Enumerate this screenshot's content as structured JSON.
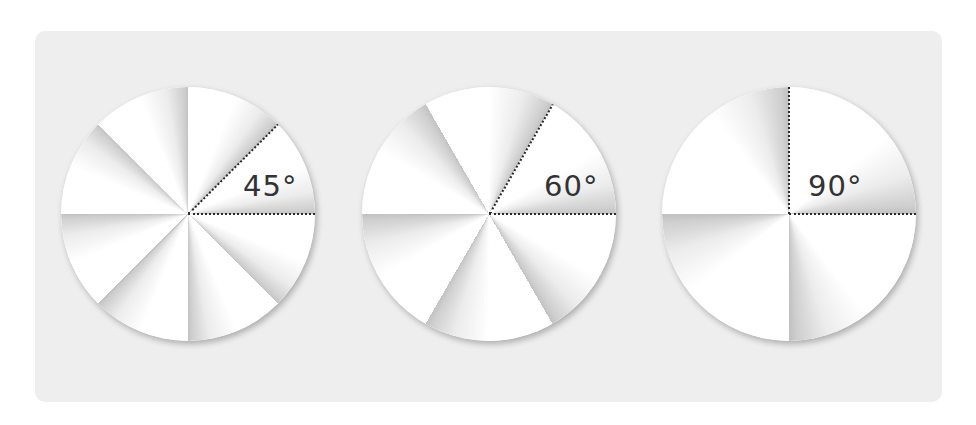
{
  "figure": {
    "background_color": "#ffffff",
    "panel_color": "#eeeeee",
    "label_color": "#333333",
    "circles": [
      {
        "id": "circle-45",
        "sector_angle": 45,
        "sector_count": 8,
        "label": "45°"
      },
      {
        "id": "circle-60",
        "sector_angle": 60,
        "sector_count": 6,
        "label": "60°"
      },
      {
        "id": "circle-90",
        "sector_angle": 90,
        "sector_count": 4,
        "label": "90°"
      }
    ]
  }
}
